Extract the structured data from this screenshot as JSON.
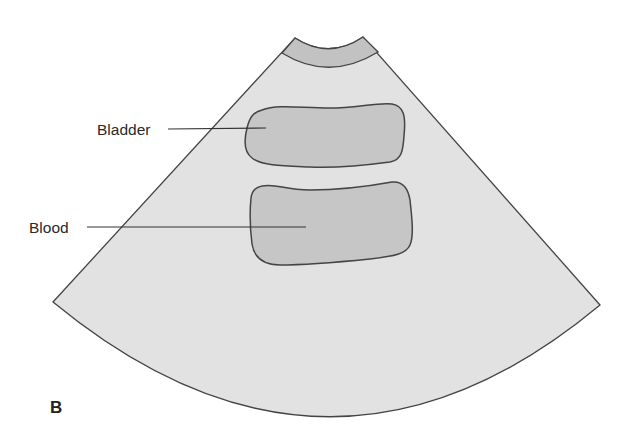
{
  "figure": {
    "panel_label": "B",
    "colors": {
      "background": "#ffffff",
      "sector_fill": "#e2e2e2",
      "probe_band_fill": "#c2c2c2",
      "structure_fill": "#c6c6c6",
      "outline": "#444444",
      "label_text": "#2a2a2a"
    }
  },
  "structures": [
    {
      "id": "bladder",
      "label": "Bladder"
    },
    {
      "id": "blood",
      "label": "Blood"
    }
  ]
}
